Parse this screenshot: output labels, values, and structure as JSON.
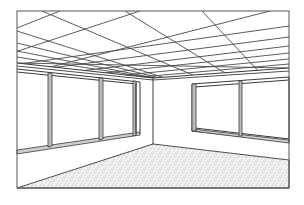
{
  "image": {
    "subject": "Line drawing of an empty room interior in two-point perspective",
    "elements": [
      "ceiling-tile-grid",
      "left-wall-windows",
      "right-wall-windows",
      "wall-corner",
      "speckled-carpet-floor"
    ],
    "colors": {
      "line": "#3a3a3a",
      "background": "#ffffff",
      "floor_speckle": "#555555",
      "mullion": "#bdbdbd"
    },
    "frame": {
      "left": 17,
      "top": 11,
      "right": 289,
      "bottom": 188
    },
    "corner": {
      "x": 153,
      "top": 78,
      "bottom": 144
    }
  }
}
